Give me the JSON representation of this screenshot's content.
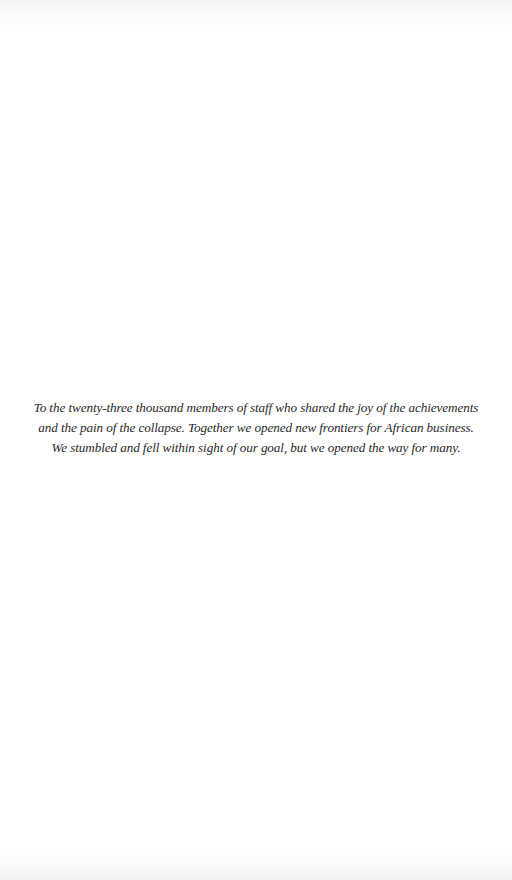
{
  "page": {
    "type": "dedication",
    "background_color": "#ffffff",
    "text_color": "#2a2a2a"
  },
  "dedication": {
    "lines": [
      "To the twenty-three thousand members of staff who shared the joy of the achievements",
      "and the pain of the collapse. Together we opened new frontiers for African business.",
      "We stumbled and fell within sight of our goal, but we opened the way for many."
    ]
  }
}
